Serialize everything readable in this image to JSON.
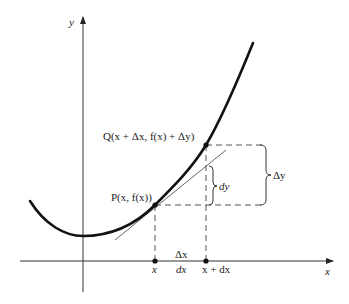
{
  "diagram": {
    "axes": {
      "x_label": "x",
      "y_label": "y"
    },
    "points": {
      "P": {
        "label": "P(x, f(x))"
      },
      "Q": {
        "label": "Q(x + Δx, f(x) + Δy)"
      }
    },
    "x_ticks": {
      "x": "x",
      "x_plus_dx": "x + dx"
    },
    "increments": {
      "delta_x": "Δx",
      "dx": "dx",
      "dy": "dy",
      "delta_y": "Δy"
    },
    "colors": {
      "curve": "#111111",
      "axis": "#333333",
      "tangent": "#555555",
      "dashed": "#555555"
    }
  }
}
